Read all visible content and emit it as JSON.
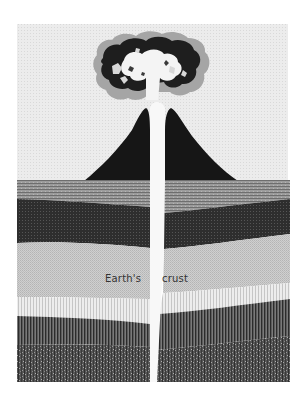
{
  "diagram": {
    "labels": {
      "left": "Earth's",
      "right": "crust"
    },
    "elements": {
      "sky": "sky",
      "eruption_cloud": "eruption cloud",
      "volcano_cone": "volcano cone",
      "conduit": "magma conduit",
      "strata": [
        "upper stratum",
        "dark stratum",
        "light stratum",
        "striped stratum",
        "deep stratum",
        "speckled bedrock"
      ]
    }
  },
  "colors": {
    "background": "#ffffff",
    "sky": "#ebebeb",
    "cone": "#161616",
    "cloud_dark": "#1e1e1e",
    "cloud_mid": "#9a9a9a",
    "upper_stratum": "#8e8e8e",
    "dark_stratum": "#343434",
    "light_stratum": "#c7c7c7",
    "striped_stratum": "#e2e2e2",
    "deep_stratum": "#4a4a4a",
    "bedrock": "#5a5a5a",
    "text": "#333333"
  }
}
